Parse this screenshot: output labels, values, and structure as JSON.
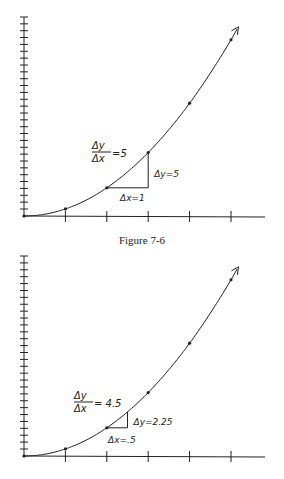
{
  "caption": "Figure 7-6",
  "colors": {
    "ink": "#222222",
    "background": "#ffffff"
  },
  "chart_data": [
    {
      "type": "line",
      "title": "",
      "function": "y = x^2",
      "x": [
        0,
        1,
        2,
        3,
        4,
        5
      ],
      "values": [
        0,
        1,
        4,
        9,
        16,
        25
      ],
      "xlabel": "",
      "ylabel": "",
      "xlim": [
        0,
        5.8
      ],
      "ylim": [
        0,
        28
      ],
      "x_ticks": 5,
      "y_ticks": 28,
      "grid": false,
      "annotations": {
        "slope_label_num": "Δy",
        "slope_label_den": "Δx",
        "slope_value": "=5",
        "dy_label": "Δy=5",
        "dx_label": "Δx=1",
        "triangle": {
          "x0": 2,
          "x1": 3,
          "y0": 4,
          "y1": 9
        }
      }
    },
    {
      "type": "line",
      "title": "",
      "function": "y = x^2",
      "x": [
        0,
        1,
        2,
        3,
        4,
        5
      ],
      "values": [
        0,
        1,
        4,
        9,
        16,
        25
      ],
      "xlabel": "",
      "ylabel": "",
      "xlim": [
        0,
        5.8
      ],
      "ylim": [
        0,
        28
      ],
      "x_ticks": 5,
      "y_ticks": 28,
      "grid": false,
      "annotations": {
        "slope_label_num": "Δy",
        "slope_label_den": "Δx",
        "slope_value": "= 4.5",
        "dy_label": "Δy=2.25",
        "dx_label": "Δx=.5",
        "triangle": {
          "x0": 2,
          "x1": 2.5,
          "y0": 4,
          "y1": 6.25
        }
      }
    }
  ]
}
